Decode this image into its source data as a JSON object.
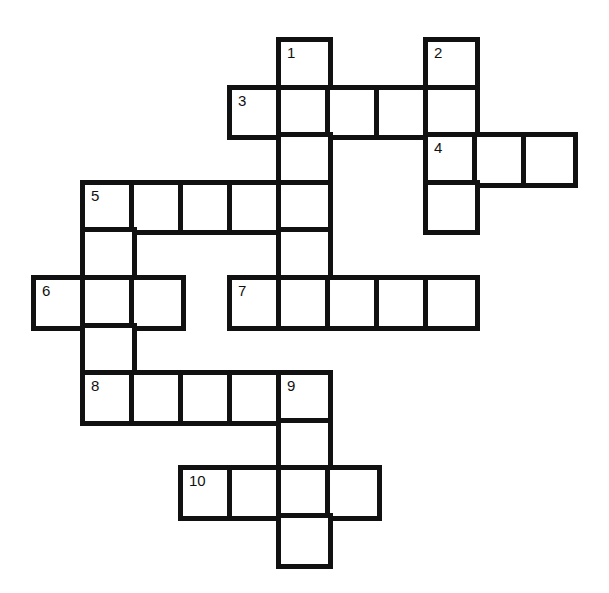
{
  "puzzle": {
    "type": "crossword",
    "grid_origin": {
      "x": 35,
      "y": 41
    },
    "cell_width": 49,
    "cell_height": 47.6,
    "colors": {
      "border": "#111111",
      "cell_fill": "#ffffff",
      "background": "#ffffff"
    },
    "cells": [
      {
        "col": 5,
        "row": 0,
        "number": "1"
      },
      {
        "col": 8,
        "row": 0,
        "number": "2"
      },
      {
        "col": 4,
        "row": 1,
        "number": "3"
      },
      {
        "col": 5,
        "row": 1
      },
      {
        "col": 6,
        "row": 1
      },
      {
        "col": 7,
        "row": 1
      },
      {
        "col": 8,
        "row": 1
      },
      {
        "col": 5,
        "row": 2
      },
      {
        "col": 8,
        "row": 2,
        "number": "4"
      },
      {
        "col": 9,
        "row": 2
      },
      {
        "col": 10,
        "row": 2
      },
      {
        "col": 1,
        "row": 3,
        "number": "5"
      },
      {
        "col": 2,
        "row": 3
      },
      {
        "col": 3,
        "row": 3
      },
      {
        "col": 4,
        "row": 3
      },
      {
        "col": 5,
        "row": 3
      },
      {
        "col": 8,
        "row": 3
      },
      {
        "col": 1,
        "row": 4
      },
      {
        "col": 5,
        "row": 4
      },
      {
        "col": 0,
        "row": 5,
        "number": "6"
      },
      {
        "col": 1,
        "row": 5
      },
      {
        "col": 2,
        "row": 5
      },
      {
        "col": 4,
        "row": 5,
        "number": "7"
      },
      {
        "col": 5,
        "row": 5
      },
      {
        "col": 6,
        "row": 5
      },
      {
        "col": 7,
        "row": 5
      },
      {
        "col": 8,
        "row": 5
      },
      {
        "col": 1,
        "row": 6
      },
      {
        "col": 1,
        "row": 7,
        "number": "8"
      },
      {
        "col": 2,
        "row": 7
      },
      {
        "col": 3,
        "row": 7
      },
      {
        "col": 4,
        "row": 7
      },
      {
        "col": 5,
        "row": 7,
        "number": "9"
      },
      {
        "col": 5,
        "row": 8
      },
      {
        "col": 3,
        "row": 9,
        "number": "10"
      },
      {
        "col": 4,
        "row": 9
      },
      {
        "col": 5,
        "row": 9
      },
      {
        "col": 6,
        "row": 9
      },
      {
        "col": 5,
        "row": 10
      }
    ],
    "entries": [
      {
        "number": "1",
        "direction": "down",
        "length": 6
      },
      {
        "number": "2",
        "direction": "down",
        "length": 4
      },
      {
        "number": "3",
        "direction": "across",
        "length": 5
      },
      {
        "number": "4",
        "direction": "across",
        "length": 3
      },
      {
        "number": "5",
        "direction": "across",
        "length": 5
      },
      {
        "number": "5",
        "direction": "down",
        "length": 5
      },
      {
        "number": "6",
        "direction": "across",
        "length": 3
      },
      {
        "number": "7",
        "direction": "across",
        "length": 5
      },
      {
        "number": "8",
        "direction": "across",
        "length": 5
      },
      {
        "number": "9",
        "direction": "down",
        "length": 4
      },
      {
        "number": "10",
        "direction": "across",
        "length": 4
      }
    ]
  }
}
